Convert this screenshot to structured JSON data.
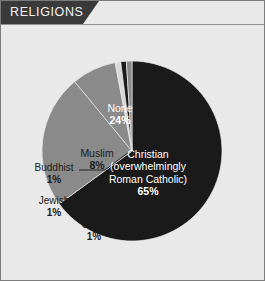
{
  "panel": {
    "header_label": "RELIGIONS",
    "background_color": "#e9e9e9",
    "header_color": "#3a3a3a",
    "header_text_color": "#f2f2f2",
    "border_color": "#7c7c7c"
  },
  "chart_data": {
    "type": "pie",
    "title": "RELIGIONS",
    "labels": [
      "Christian (overwhelmingly Roman Catholic)",
      "None",
      "Muslim",
      "Buddhist",
      "Jewish",
      "Other"
    ],
    "values": [
      65,
      24,
      8,
      1,
      1,
      1
    ],
    "value_suffix": "%",
    "colors": [
      "#1a1a1a",
      "#8a8a8a",
      "#8a8a8a",
      "#d8d8d8",
      "#1a1a1a",
      "#8a8a8a"
    ],
    "start_angle_deg": 0,
    "direction": "clockwise",
    "legend": "none",
    "grid": false,
    "slices": [
      {
        "key": "christian",
        "name_line1": "Christian",
        "name_line2": "(overwhelmingly",
        "name_line3": "Roman Catholic)",
        "percent_label": "65%",
        "value": 65,
        "color": "#1a1a1a",
        "label_placement": "inside",
        "label_color": "#ffffff"
      },
      {
        "key": "none",
        "name": "None",
        "percent_label": "24%",
        "value": 24,
        "color": "#8a8a8a",
        "label_placement": "inside",
        "label_color": "#ffffff"
      },
      {
        "key": "muslim",
        "name": "Muslim",
        "percent_label": "8%",
        "value": 8,
        "color": "#8a8a8a",
        "label_placement": "outside",
        "label_color": "#1b1b1b"
      },
      {
        "key": "buddhist",
        "name": "Buddhist",
        "percent_label": "1%",
        "value": 1,
        "color": "#d8d8d8",
        "label_placement": "outside-leader",
        "label_color": "#1b1b1b"
      },
      {
        "key": "jewish",
        "name": "Jewish",
        "percent_label": "1%",
        "value": 1,
        "color": "#1a1a1a",
        "label_placement": "outside-leader",
        "label_color": "#1b1b1b"
      },
      {
        "key": "other",
        "name": "Other",
        "percent_label": "1%",
        "value": 1,
        "color": "#8a8a8a",
        "label_placement": "outside-leader",
        "label_color": "#1b1b1b"
      }
    ]
  }
}
